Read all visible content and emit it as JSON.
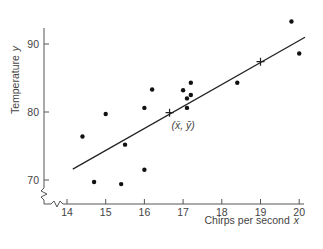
{
  "chart_data": {
    "type": "scatter",
    "title": "",
    "xlabel": "Chirps per second",
    "xlabel_var": "x",
    "ylabel": "Temperature",
    "ylabel_var": "y",
    "xlim": [
      13.4,
      20.3
    ],
    "ylim": [
      66,
      93.5
    ],
    "x_ticks": [
      14,
      15,
      16,
      17,
      18,
      19,
      20
    ],
    "y_ticks": [
      70,
      80,
      90
    ],
    "axis_breaks": true,
    "grid": false,
    "legend": null,
    "points": [
      {
        "x": 14.4,
        "y": 76.4
      },
      {
        "x": 14.7,
        "y": 69.7
      },
      {
        "x": 15.0,
        "y": 79.7
      },
      {
        "x": 15.4,
        "y": 69.4
      },
      {
        "x": 15.5,
        "y": 75.2
      },
      {
        "x": 16.0,
        "y": 71.5
      },
      {
        "x": 16.0,
        "y": 80.6
      },
      {
        "x": 16.2,
        "y": 83.3
      },
      {
        "x": 17.0,
        "y": 83.2
      },
      {
        "x": 17.1,
        "y": 80.6
      },
      {
        "x": 17.1,
        "y": 82.0
      },
      {
        "x": 17.2,
        "y": 82.5
      },
      {
        "x": 17.2,
        "y": 84.3
      },
      {
        "x": 18.4,
        "y": 84.3
      },
      {
        "x": 19.8,
        "y": 93.3
      },
      {
        "x": 20.0,
        "y": 88.6
      }
    ],
    "regression_line": {
      "x": [
        14.15,
        20.15
      ],
      "y": [
        71.6,
        91.0
      ]
    },
    "markers": [
      {
        "label": "mean",
        "x": 16.65,
        "y": 79.9,
        "shape": "plus"
      },
      {
        "label": "second",
        "x": 19.0,
        "y": 87.4,
        "shape": "plus"
      }
    ],
    "annotations": [
      {
        "text": "(x̄, ȳ)",
        "x": 16.7,
        "y": 77.5
      }
    ]
  }
}
